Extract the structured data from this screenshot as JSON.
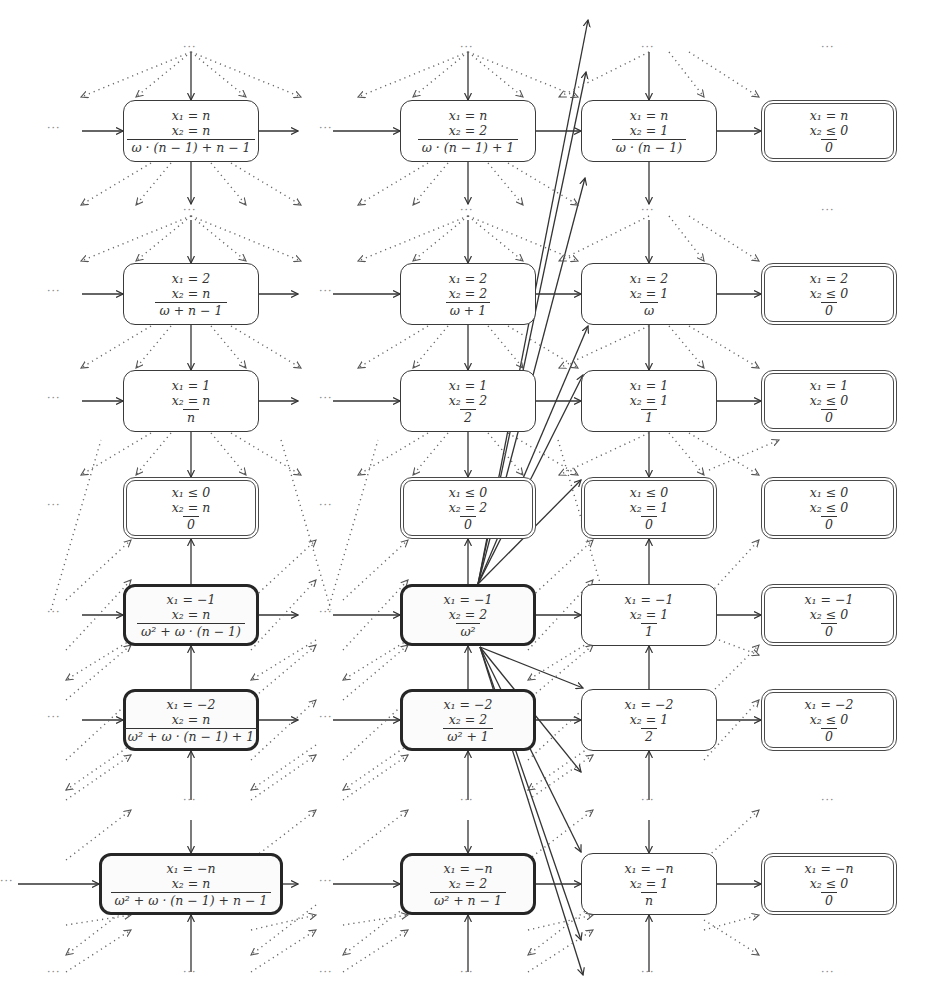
{
  "diagram": {
    "columns": [
      "x2 = n",
      "x2 = 2",
      "x2 = 1",
      "x2 <= 0"
    ],
    "nodes": [
      {
        "id": "n_n_n",
        "col": 0,
        "row": 0,
        "style": "normal",
        "x1": "x₁ = n",
        "x2": "x₂ = n",
        "rank": "ω · (n − 1) + n − 1"
      },
      {
        "id": "n_2_n",
        "col": 0,
        "row": 1,
        "style": "normal",
        "x1": "x₁ = 2",
        "x2": "x₂ = n",
        "rank": "ω + n − 1"
      },
      {
        "id": "n_1_n",
        "col": 0,
        "row": 2,
        "style": "normal",
        "x1": "x₁ = 1",
        "x2": "x₂ = n",
        "rank": "n"
      },
      {
        "id": "n_le0_n",
        "col": 0,
        "row": 3,
        "style": "final",
        "x1": "x₁ ≤ 0",
        "x2": "x₂ = n",
        "rank": "0"
      },
      {
        "id": "n_m1_n",
        "col": 0,
        "row": 4,
        "style": "thick",
        "x1": "x₁ = −1",
        "x2": "x₂ = n",
        "rank": "ω² + ω · (n − 1)"
      },
      {
        "id": "n_m2_n",
        "col": 0,
        "row": 5,
        "style": "thick",
        "x1": "x₁ = −2",
        "x2": "x₂ = n",
        "rank": "ω² + ω · (n − 1) + 1"
      },
      {
        "id": "n_mn_n",
        "col": 0,
        "row": 6,
        "style": "thick",
        "x1": "x₁ = −n",
        "x2": "x₂ = n",
        "rank": "ω² + ω · (n − 1) + n − 1"
      },
      {
        "id": "n_n_2",
        "col": 1,
        "row": 0,
        "style": "normal",
        "x1": "x₁ = n",
        "x2": "x₂ = 2",
        "rank": "ω · (n − 1) + 1"
      },
      {
        "id": "n_2_2",
        "col": 1,
        "row": 1,
        "style": "normal",
        "x1": "x₁ = 2",
        "x2": "x₂ = 2",
        "rank": "ω + 1"
      },
      {
        "id": "n_1_2",
        "col": 1,
        "row": 2,
        "style": "normal",
        "x1": "x₁ = 1",
        "x2": "x₂ = 2",
        "rank": "2"
      },
      {
        "id": "n_le0_2",
        "col": 1,
        "row": 3,
        "style": "final",
        "x1": "x₁ ≤ 0",
        "x2": "x₂ = 2",
        "rank": "0"
      },
      {
        "id": "n_m1_2",
        "col": 1,
        "row": 4,
        "style": "thick",
        "x1": "x₁ = −1",
        "x2": "x₂ = 2",
        "rank": "ω²"
      },
      {
        "id": "n_m2_2",
        "col": 1,
        "row": 5,
        "style": "thick",
        "x1": "x₁ = −2",
        "x2": "x₂ = 2",
        "rank": "ω² + 1"
      },
      {
        "id": "n_mn_2",
        "col": 1,
        "row": 6,
        "style": "thick",
        "x1": "x₁ = −n",
        "x2": "x₂ = 2",
        "rank": "ω² + n − 1"
      },
      {
        "id": "n_n_1",
        "col": 2,
        "row": 0,
        "style": "normal",
        "x1": "x₁ = n",
        "x2": "x₂ = 1",
        "rank": "ω · (n − 1)"
      },
      {
        "id": "n_2_1",
        "col": 2,
        "row": 1,
        "style": "normal",
        "x1": "x₁ = 2",
        "x2": "x₂ = 1",
        "rank": "ω"
      },
      {
        "id": "n_1_1",
        "col": 2,
        "row": 2,
        "style": "normal",
        "x1": "x₁ = 1",
        "x2": "x₂ = 1",
        "rank": "1"
      },
      {
        "id": "n_le0_1",
        "col": 2,
        "row": 3,
        "style": "final",
        "x1": "x₁ ≤ 0",
        "x2": "x₂ = 1",
        "rank": "0"
      },
      {
        "id": "n_m1_1",
        "col": 2,
        "row": 4,
        "style": "normal",
        "x1": "x₁ = −1",
        "x2": "x₂ = 1",
        "rank": "1"
      },
      {
        "id": "n_m2_1",
        "col": 2,
        "row": 5,
        "style": "normal",
        "x1": "x₁ = −2",
        "x2": "x₂ = 1",
        "rank": "2"
      },
      {
        "id": "n_mn_1",
        "col": 2,
        "row": 6,
        "style": "normal",
        "x1": "x₁ = −n",
        "x2": "x₂ = 1",
        "rank": "n"
      },
      {
        "id": "n_n_0",
        "col": 3,
        "row": 0,
        "style": "final",
        "x1": "x₁ = n",
        "x2": "x₂ ≤ 0",
        "rank": "0"
      },
      {
        "id": "n_2_0",
        "col": 3,
        "row": 1,
        "style": "final",
        "x1": "x₁ = 2",
        "x2": "x₂ ≤ 0",
        "rank": "0"
      },
      {
        "id": "n_1_0",
        "col": 3,
        "row": 2,
        "style": "final",
        "x1": "x₁ = 1",
        "x2": "x₂ ≤ 0",
        "rank": "0"
      },
      {
        "id": "n_le0_0",
        "col": 3,
        "row": 3,
        "style": "final",
        "x1": "x₁ ≤ 0",
        "x2": "x₂ ≤ 0",
        "rank": "0"
      },
      {
        "id": "n_m1_0",
        "col": 3,
        "row": 4,
        "style": "final",
        "x1": "x₁ = −1",
        "x2": "x₂ ≤ 0",
        "rank": "0"
      },
      {
        "id": "n_m2_0",
        "col": 3,
        "row": 5,
        "style": "final",
        "x1": "x₁ = −2",
        "x2": "x₂ ≤ 0",
        "rank": "0"
      },
      {
        "id": "n_mn_0",
        "col": 3,
        "row": 6,
        "style": "final",
        "x1": "x₁ = −n",
        "x2": "x₂ ≤ 0",
        "rank": "0"
      }
    ],
    "ellipsis": "···"
  }
}
